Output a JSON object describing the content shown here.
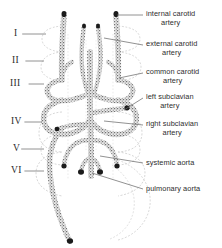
{
  "figure": {
    "background_color": "#ffffff",
    "ink_color": "#3a3a3a",
    "ghost_color": "#c9c9c9",
    "leader_color": "#6e6e6e"
  },
  "arch_numerals": [
    {
      "label": "I",
      "x": 14,
      "y": 28,
      "leader_to_x": 46
    },
    {
      "label": "II",
      "x": 12,
      "y": 55,
      "leader_to_x": 44
    },
    {
      "label": "III",
      "x": 10,
      "y": 78,
      "leader_to_x": 44
    },
    {
      "label": "IV",
      "x": 11,
      "y": 116,
      "leader_to_x": 42
    },
    {
      "label": "V",
      "x": 13,
      "y": 143,
      "leader_to_x": 44
    },
    {
      "label": "VI",
      "x": 11,
      "y": 165,
      "leader_to_x": 44
    }
  ],
  "labels": [
    {
      "id": "internal-carotid-artery",
      "text": "internal carotid\nartery",
      "x": 146,
      "y": 10,
      "leader": [
        143,
        15,
        117,
        15
      ]
    },
    {
      "id": "external-carotid-artery",
      "text": "external carotid\nartery",
      "x": 146,
      "y": 40,
      "leader": [
        143,
        45,
        104,
        38
      ]
    },
    {
      "id": "common-carotid-artery",
      "text": "common carotid\nartery",
      "x": 146,
      "y": 68,
      "leader": [
        143,
        73,
        119,
        78
      ]
    },
    {
      "id": "left-subclavian-artery",
      "text": "left subclavian\nartery",
      "x": 146,
      "y": 93,
      "leader": [
        143,
        98,
        124,
        110
      ]
    },
    {
      "id": "right-subclavian-artery",
      "text": "right subclavian\nartery",
      "x": 146,
      "y": 120,
      "leader": [
        143,
        125,
        104,
        121
      ]
    },
    {
      "id": "systemic-aorta",
      "text": "systemic aorta",
      "x": 146,
      "y": 159,
      "leader": [
        143,
        163,
        100,
        156
      ]
    },
    {
      "id": "pulmonary-aorta",
      "text": "pulmonary aorta",
      "x": 146,
      "y": 185,
      "leader": [
        143,
        189,
        92,
        173
      ]
    }
  ]
}
